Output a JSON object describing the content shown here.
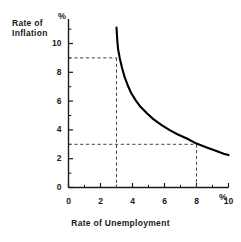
{
  "chart_data": {
    "type": "line",
    "title": "",
    "xlabel": "Rate of Unemployment",
    "ylabel_line1": "Rate of",
    "ylabel_line2": "Inflation",
    "x_unit_symbol": "%",
    "y_unit_symbol": "%",
    "xlim": [
      0,
      10
    ],
    "ylim": [
      0,
      11.5
    ],
    "grid": false,
    "legend": null,
    "x_ticks": [
      0,
      2,
      4,
      6,
      8,
      10
    ],
    "x_tick_labels": [
      "0",
      "2",
      "4",
      "6",
      "8",
      "10"
    ],
    "x_minor_ticks": [
      1,
      3,
      5,
      7,
      9
    ],
    "y_ticks": [
      0,
      2,
      4,
      6,
      8,
      10
    ],
    "y_tick_labels": [
      "0",
      "2",
      "4",
      "6",
      "8",
      "10"
    ],
    "y_minor_ticks": [
      1,
      3,
      5,
      7,
      9,
      11
    ],
    "series": [
      {
        "name": "Phillips curve",
        "color": "#000000",
        "points": [
          [
            3.0,
            11.1
          ],
          [
            3.05,
            10.2
          ],
          [
            3.1,
            9.6
          ],
          [
            3.2,
            9.0
          ],
          [
            3.35,
            8.3
          ],
          [
            3.5,
            7.7
          ],
          [
            3.7,
            7.1
          ],
          [
            3.9,
            6.6
          ],
          [
            4.2,
            6.05
          ],
          [
            4.5,
            5.6
          ],
          [
            4.9,
            5.15
          ],
          [
            5.3,
            4.75
          ],
          [
            5.8,
            4.35
          ],
          [
            6.3,
            4.0
          ],
          [
            6.8,
            3.7
          ],
          [
            7.4,
            3.4
          ],
          [
            8.0,
            3.05
          ],
          [
            8.6,
            2.8
          ],
          [
            9.2,
            2.55
          ],
          [
            9.7,
            2.35
          ],
          [
            10.0,
            2.25
          ]
        ]
      }
    ],
    "annotations": [
      {
        "name": "guide-low-unemployment",
        "style": "dashed",
        "x": 3,
        "y": 9,
        "description": "9% inflation at 3% unemployment"
      },
      {
        "name": "guide-high-unemployment",
        "style": "dashed",
        "x": 8,
        "y": 3,
        "description": "3% inflation at 8% unemployment"
      }
    ]
  },
  "axes": {
    "y_title_line1": "Rate of",
    "y_title_line2": "Inflation",
    "y_percent": "%",
    "x_title": "Rate of  Unemployment",
    "x_percent": "%"
  },
  "colors": {
    "background": "#ffffff",
    "ink": "#1a1a1a",
    "curve": "#000000",
    "dashed": "#444444"
  }
}
